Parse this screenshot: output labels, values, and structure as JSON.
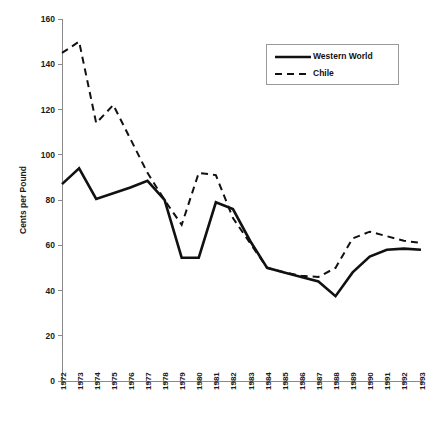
{
  "chart_data": {
    "type": "line",
    "title": "",
    "subtitle": "",
    "xlabel": "",
    "ylabel": "Cents per Pound",
    "ylim": [
      0,
      160
    ],
    "ytick_step": 20,
    "yticks": [
      "0",
      "20",
      "40",
      "60",
      "80",
      "100",
      "120",
      "140",
      "160"
    ],
    "grid": false,
    "legend_position": "top-right",
    "categories": [
      "1972",
      "1973",
      "1974",
      "1975",
      "1976",
      "1977",
      "1978",
      "1979",
      "1980",
      "1981",
      "1982",
      "1983",
      "1984",
      "1985",
      "1986",
      "1987",
      "1988",
      "1989",
      "1990",
      "1991",
      "1992",
      "1993"
    ],
    "series": [
      {
        "name": "Western World",
        "style": "solid",
        "color": "#111111",
        "values": [
          87,
          94,
          80.5,
          83,
          85.5,
          88.5,
          80,
          54.5,
          54.5,
          79,
          76,
          62,
          50,
          48,
          46,
          44,
          37.5,
          48,
          55,
          58,
          58.5,
          58
        ]
      },
      {
        "name": "Chile",
        "style": "dashed",
        "color": "#111111",
        "values": [
          145,
          150,
          114,
          122,
          107,
          92,
          80,
          69,
          92,
          91,
          72,
          61,
          50,
          48,
          46.5,
          46,
          50,
          63,
          66,
          64,
          62,
          61
        ]
      }
    ]
  },
  "legend": {
    "items": [
      {
        "label": "Western World",
        "style": "solid"
      },
      {
        "label": "Chile",
        "style": "dashed"
      }
    ]
  }
}
